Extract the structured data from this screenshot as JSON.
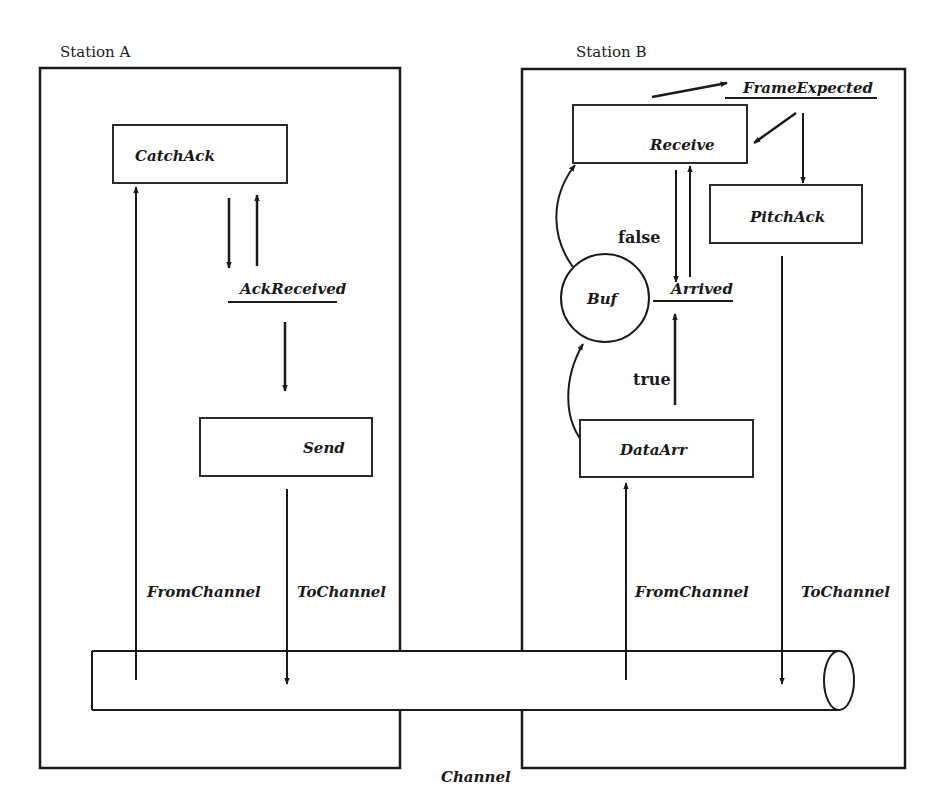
{
  "diagram": {
    "stations": [
      {
        "id": "A",
        "label": "Station A"
      },
      {
        "id": "B",
        "label": "Station B"
      }
    ],
    "processes": {
      "catch_ack": "CatchAck",
      "send": "Send",
      "receive": "Receive",
      "pitch_ack": "PitchAck",
      "data_arr": "DataArr"
    },
    "variables": {
      "ack_received": "AckReceived",
      "frame_expected": "FrameExpected",
      "arrived": "Arrived"
    },
    "store": {
      "buf": "Buf"
    },
    "conditions": {
      "false_label": "false",
      "true_label": "true"
    },
    "connectors": {
      "a_from_channel": "FromChannel",
      "a_to_channel": "ToChannel",
      "b_from_channel": "FromChannel",
      "b_to_channel": "ToChannel"
    },
    "channel": {
      "label": "Channel"
    }
  }
}
